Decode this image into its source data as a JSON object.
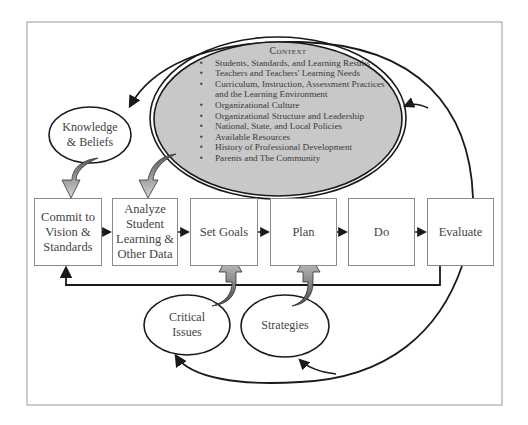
{
  "context": {
    "title": "Context",
    "items": [
      "Students, Standards, and Learning Results",
      "Teachers and Teachers' Learning Needs",
      "Curriculum, Instruction, Assessment Practices and the Learning Environment",
      "Organizational Culture",
      "Organizational Structure and Leadership",
      "National, State, and Local Policies",
      "Available Resources",
      "History of Professional Development",
      "Parents and The Community"
    ]
  },
  "inputs": {
    "knowledge": "Knowledge\n& Beliefs",
    "critical_issues": "Critical\nIssues",
    "strategies": "Strategies"
  },
  "steps": [
    {
      "label": "Commit to\nVision &\nStandards"
    },
    {
      "label": "Analyze\nStudent\nLearning &\nOther Data"
    },
    {
      "label": "Set Goals"
    },
    {
      "label": "Plan"
    },
    {
      "label": "Do"
    },
    {
      "label": "Evaluate"
    }
  ],
  "colors": {
    "context_fill": "#c8c8c8",
    "stroke": "#1a1a1a",
    "frame": "#9a9a9a",
    "arrow_light": "#d8d8d8",
    "arrow_dark": "#5a5a5a"
  }
}
